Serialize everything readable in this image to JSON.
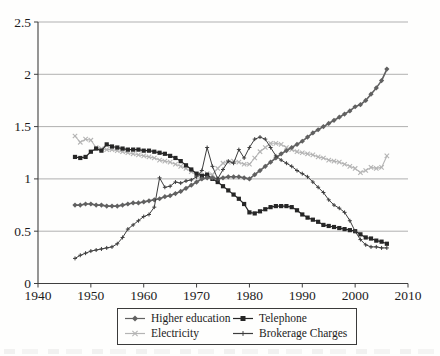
{
  "figure": {
    "background": "#fefefd",
    "axis_color": "#3f3f3f",
    "grid_color": "#8f8f8f",
    "label_color": "#1c1c1c"
  },
  "chart_data": {
    "type": "line",
    "title": "",
    "xlabel": "",
    "ylabel": "",
    "xlim": [
      1940,
      2010
    ],
    "ylim": [
      0,
      2.5
    ],
    "xticks": [
      1940,
      1950,
      1960,
      1970,
      1980,
      1990,
      2000,
      2010
    ],
    "xtick_labels": [
      "1940",
      "1950",
      "1960",
      "1970",
      "1980",
      "1990",
      "2000",
      "2010"
    ],
    "yticks": [
      0,
      0.5,
      1,
      1.5,
      2,
      2.5
    ],
    "ytick_labels": [
      "0",
      "0.5",
      "1",
      "1.5",
      "2",
      "2.5"
    ],
    "grid": "horizontal",
    "legend_position": "bottom-boxed",
    "x": [
      1947,
      1948,
      1949,
      1950,
      1951,
      1952,
      1953,
      1954,
      1955,
      1956,
      1957,
      1958,
      1959,
      1960,
      1961,
      1962,
      1963,
      1964,
      1965,
      1966,
      1967,
      1968,
      1969,
      1970,
      1971,
      1972,
      1973,
      1974,
      1975,
      1976,
      1977,
      1978,
      1979,
      1980,
      1981,
      1982,
      1983,
      1984,
      1985,
      1986,
      1987,
      1988,
      1989,
      1990,
      1991,
      1992,
      1993,
      1994,
      1995,
      1996,
      1997,
      1998,
      1999,
      2000,
      2001,
      2002,
      2003,
      2004,
      2005,
      2006
    ],
    "series": [
      {
        "name": "Higher education",
        "marker": "diamond",
        "color": "#616161",
        "line_width": 1.6,
        "marker_size": 2.6,
        "values": [
          0.75,
          0.75,
          0.76,
          0.76,
          0.75,
          0.75,
          0.74,
          0.74,
          0.74,
          0.75,
          0.76,
          0.77,
          0.77,
          0.78,
          0.79,
          0.8,
          0.81,
          0.83,
          0.84,
          0.86,
          0.88,
          0.91,
          0.94,
          0.97,
          1.0,
          1.01,
          1.01,
          1.0,
          1.01,
          1.02,
          1.02,
          1.02,
          1.01,
          1.0,
          1.04,
          1.08,
          1.12,
          1.16,
          1.2,
          1.24,
          1.27,
          1.3,
          1.33,
          1.36,
          1.4,
          1.44,
          1.47,
          1.5,
          1.53,
          1.56,
          1.59,
          1.62,
          1.65,
          1.69,
          1.71,
          1.75,
          1.81,
          1.87,
          1.94,
          2.05
        ]
      },
      {
        "name": "Telephone",
        "marker": "square",
        "color": "#262626",
        "line_width": 1.2,
        "marker_size": 2.1,
        "values": [
          1.21,
          1.2,
          1.21,
          1.26,
          1.29,
          1.27,
          1.33,
          1.31,
          1.3,
          1.29,
          1.28,
          1.28,
          1.28,
          1.27,
          1.27,
          1.26,
          1.25,
          1.24,
          1.22,
          1.2,
          1.17,
          1.13,
          1.09,
          1.05,
          1.03,
          1.04,
          1.0,
          0.97,
          0.93,
          0.89,
          0.85,
          0.81,
          0.76,
          0.68,
          0.67,
          0.69,
          0.71,
          0.73,
          0.74,
          0.74,
          0.74,
          0.73,
          0.7,
          0.66,
          0.63,
          0.61,
          0.59,
          0.56,
          0.55,
          0.54,
          0.53,
          0.52,
          0.51,
          0.5,
          0.47,
          0.44,
          0.43,
          0.41,
          0.4,
          0.38
        ]
      },
      {
        "name": "Electricity",
        "marker": "x",
        "color": "#b4b4b4",
        "line_width": 1.1,
        "marker_size": 2.2,
        "values": [
          1.41,
          1.35,
          1.38,
          1.37,
          1.3,
          1.29,
          1.28,
          1.28,
          1.27,
          1.26,
          1.25,
          1.24,
          1.23,
          1.22,
          1.21,
          1.2,
          1.18,
          1.17,
          1.16,
          1.14,
          1.12,
          1.1,
          1.07,
          1.04,
          1.03,
          1.05,
          1.04,
          1.1,
          1.15,
          1.16,
          1.17,
          1.16,
          1.14,
          1.14,
          1.2,
          1.26,
          1.3,
          1.34,
          1.34,
          1.33,
          1.3,
          1.28,
          1.26,
          1.25,
          1.24,
          1.23,
          1.21,
          1.2,
          1.18,
          1.17,
          1.16,
          1.14,
          1.12,
          1.1,
          1.06,
          1.08,
          1.11,
          1.1,
          1.11,
          1.22
        ]
      },
      {
        "name": "Brokerage Charges",
        "marker": "plus",
        "color": "#3d3d3d",
        "line_width": 1.0,
        "marker_size": 2.0,
        "values": [
          0.24,
          0.27,
          0.29,
          0.31,
          0.32,
          0.33,
          0.34,
          0.35,
          0.38,
          0.44,
          0.52,
          0.56,
          0.6,
          0.64,
          0.66,
          0.73,
          1.01,
          0.92,
          0.93,
          0.97,
          0.96,
          0.98,
          0.99,
          1.02,
          1.08,
          1.3,
          1.12,
          1.0,
          1.09,
          1.17,
          1.15,
          1.28,
          1.2,
          1.3,
          1.38,
          1.4,
          1.38,
          1.3,
          1.22,
          1.18,
          1.15,
          1.12,
          1.08,
          1.05,
          1.02,
          0.97,
          0.92,
          0.87,
          0.8,
          0.75,
          0.72,
          0.68,
          0.6,
          0.5,
          0.42,
          0.37,
          0.35,
          0.35,
          0.34,
          0.34
        ]
      }
    ]
  }
}
